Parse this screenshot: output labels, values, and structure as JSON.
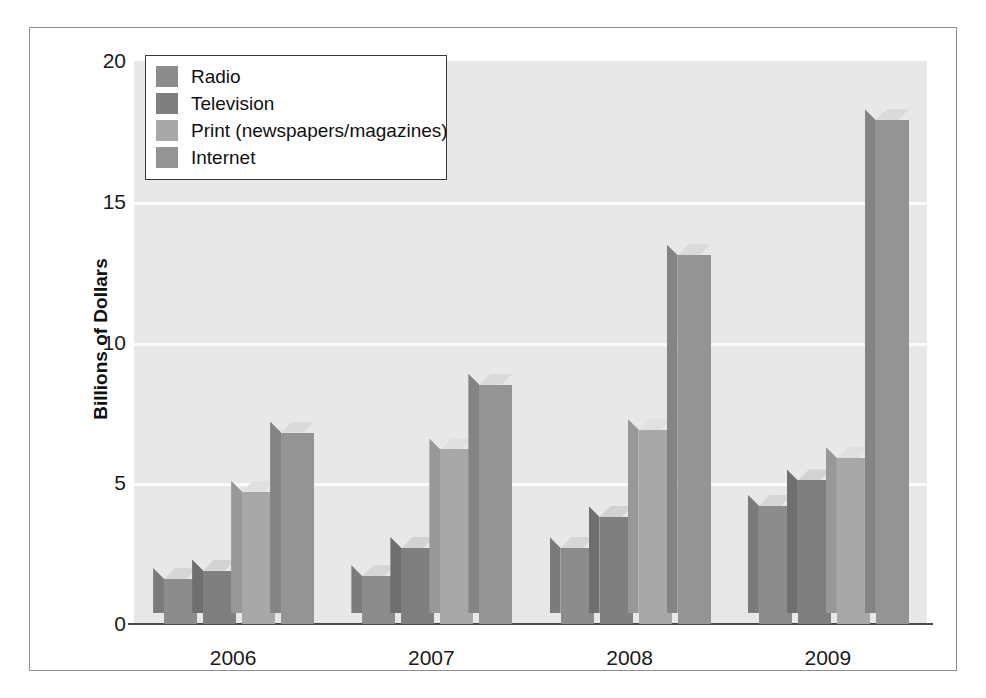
{
  "top_caption": "",
  "chart_data": {
    "type": "bar",
    "title": "",
    "subtitle": "",
    "xlabel": "",
    "ylabel": "Billions of Dollars",
    "categories": [
      "2006",
      "2007",
      "2008",
      "2009"
    ],
    "yticks": [
      "20",
      "15",
      "10",
      "5",
      "0"
    ],
    "ytick_values": [
      20,
      15,
      10,
      5,
      0
    ],
    "ylim": [
      0,
      20
    ],
    "grid": "horizontal",
    "legend_position": "top-left-inside",
    "style": "3d-grouped-bars",
    "series": [
      {
        "name": "Radio",
        "color": "#8c8c8c",
        "side_color": "#7b7b7b",
        "top_color": "#d6d6d6",
        "values": [
          1.6,
          1.7,
          2.7,
          4.2
        ]
      },
      {
        "name": "Television",
        "color": "#7f7f7f",
        "side_color": "#6f6f6f",
        "top_color": "#d2d2d2",
        "values": [
          1.9,
          2.7,
          3.8,
          5.1
        ]
      },
      {
        "name": "Print (newspapers/magazines)",
        "color": "#a8a8a8",
        "side_color": "#989898",
        "top_color": "#e0e0e0",
        "values": [
          4.7,
          6.2,
          6.9,
          5.9
        ]
      },
      {
        "name": "Internet",
        "color": "#949494",
        "side_color": "#848484",
        "top_color": "#dadada",
        "values": [
          6.8,
          8.5,
          13.1,
          17.9
        ]
      }
    ]
  },
  "colors": {
    "plot_background": "#e8e8e8",
    "gridline": "#fbfbfb",
    "axis": "#4a4a4a",
    "frame": "#8e8e8e",
    "text": "#1a1a1a",
    "legend_background": "#ffffff",
    "legend_border": "#3a3a3a"
  }
}
